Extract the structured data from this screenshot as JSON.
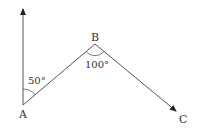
{
  "diagram": {
    "points": {
      "A": {
        "label": "A",
        "x": 23,
        "y": 105
      },
      "B": {
        "label": "B",
        "x": 95,
        "y": 44
      },
      "C": {
        "label": "C",
        "x": 178,
        "y": 112
      }
    },
    "north_arrow_tip": {
      "x": 23,
      "y": 7
    },
    "angles": [
      {
        "vertex": "A",
        "label": "50°"
      },
      {
        "vertex": "B",
        "label": "100°"
      }
    ],
    "line_color": "#333333"
  }
}
